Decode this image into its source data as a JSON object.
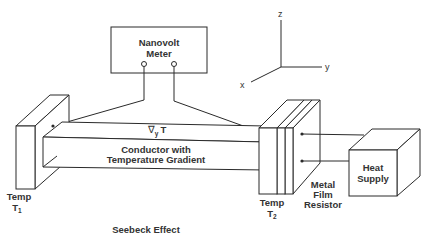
{
  "title": "Seebeck Effect",
  "meter": {
    "line1": "Nanovolt",
    "line2": "Meter"
  },
  "axes": {
    "z": "z",
    "y": "y",
    "x": "x"
  },
  "conductor": {
    "gradient_symbol": "∇",
    "gradient_subscript": "y",
    "gradient_var": "T",
    "line1": "Conductor with",
    "line2": "Temperature Gradient"
  },
  "left_plate": {
    "line1": "Temp",
    "var": "T",
    "subscript": "1"
  },
  "right_plate": {
    "line1": "Temp",
    "var": "T",
    "subscript": "2"
  },
  "resistor": {
    "line1": "Metal",
    "line2": "Film",
    "line3": "Resistor"
  },
  "heat_supply": {
    "line1": "Heat",
    "line2": "Supply"
  },
  "colors": {
    "line": "#2a2a2a",
    "text": "#333333",
    "background": "#ffffff"
  }
}
